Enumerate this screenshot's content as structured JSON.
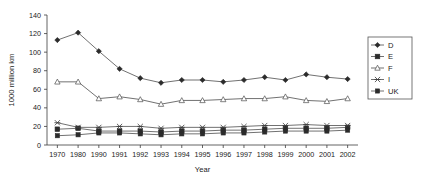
{
  "chart_data": {
    "type": "line",
    "title": "",
    "xlabel": "Year",
    "ylabel": "1000 million km",
    "categories": [
      "1970",
      "1980",
      "1990",
      "1991",
      "1992",
      "1993",
      "1994",
      "1995",
      "1996",
      "1997",
      "1998",
      "1999",
      "2000",
      "2001",
      "2002"
    ],
    "ylim": [
      0,
      140
    ],
    "yticks": [
      0,
      20,
      40,
      60,
      80,
      100,
      120,
      140
    ],
    "grid": false,
    "legend_position": "right",
    "series": [
      {
        "name": "D",
        "marker": "filled-diamond",
        "values": [
          113,
          121,
          101,
          82,
          72,
          67,
          70,
          70,
          68,
          70,
          73,
          70,
          76,
          73,
          71
        ]
      },
      {
        "name": "E",
        "marker": "filled-square",
        "values": [
          17,
          18,
          15,
          15,
          15,
          14,
          15,
          15,
          16,
          16,
          17,
          18,
          18,
          18,
          19
        ]
      },
      {
        "name": "F",
        "marker": "open-triangle",
        "values": [
          68,
          68,
          50,
          52,
          49,
          44,
          48,
          48,
          49,
          50,
          50,
          52,
          48,
          47,
          50
        ]
      },
      {
        "name": "I",
        "marker": "x-cross",
        "values": [
          24,
          19,
          19,
          20,
          20,
          18,
          19,
          19,
          19,
          20,
          21,
          21,
          22,
          21,
          21
        ]
      },
      {
        "name": "UK",
        "marker": "filled-square-small",
        "values": [
          10,
          11,
          13,
          13,
          12,
          11,
          12,
          12,
          13,
          13,
          14,
          15,
          15,
          15,
          16
        ]
      }
    ]
  },
  "axes": {
    "y_title": "1000 million km",
    "x_title": "Year",
    "y_tick_labels": [
      "140",
      "120",
      "100",
      "80",
      "60",
      "40",
      "20",
      "0"
    ],
    "x_tick_labels": [
      "1970",
      "1980",
      "1990",
      "1991",
      "1992",
      "1993",
      "1994",
      "1995",
      "1996",
      "1997",
      "1998",
      "1999",
      "2000",
      "2001",
      "2002"
    ]
  },
  "legend": {
    "items": [
      {
        "label": "D"
      },
      {
        "label": "E"
      },
      {
        "label": "F"
      },
      {
        "label": "I"
      },
      {
        "label": "UK"
      }
    ]
  },
  "colors": {
    "line": "#4d4d4d",
    "marker_fill": "#2b2b2b",
    "marker_open": "#ffffff",
    "axis": "#3c3c3c",
    "text": "#1a1a1a",
    "background": "#ffffff"
  }
}
